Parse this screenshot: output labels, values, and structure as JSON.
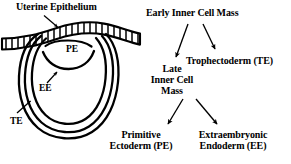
{
  "figure": {
    "width": 291,
    "height": 164,
    "background": "#ffffff",
    "ink": "#000000"
  },
  "diagram": {
    "labels": {
      "uterine_epithelium": "Uterine Epithelium",
      "pe": "PE",
      "ee": "EE",
      "te": "TE"
    }
  },
  "flowchart": {
    "nodes": {
      "early_icm": "Early Inner Cell Mass",
      "trophectoderm": "Trophectoderm (TE)",
      "late_icm_line1": "Late",
      "late_icm_line2": "Inner Cell",
      "late_icm_line3": "Mass",
      "primitive_ectoderm_line1": "Primitive",
      "primitive_ectoderm_line2": "Ectoderm (PE)",
      "extraembryonic_endoderm_line1": "Extraembryonic",
      "extraembryonic_endoderm_line2": "Endoderm (EE)"
    },
    "edges": [
      {
        "from": "early_icm",
        "to": "late_icm"
      },
      {
        "from": "early_icm",
        "to": "trophectoderm"
      },
      {
        "from": "late_icm",
        "to": "primitive_ectoderm"
      },
      {
        "from": "late_icm",
        "to": "extraembryonic_endoderm"
      }
    ]
  },
  "pointers": [
    {
      "label": "uterine_epithelium",
      "target": "epithelium-band"
    },
    {
      "label": "ee",
      "target": "inner-endoderm-layer"
    },
    {
      "label": "te",
      "target": "outer-trophectoderm-layer"
    }
  ]
}
